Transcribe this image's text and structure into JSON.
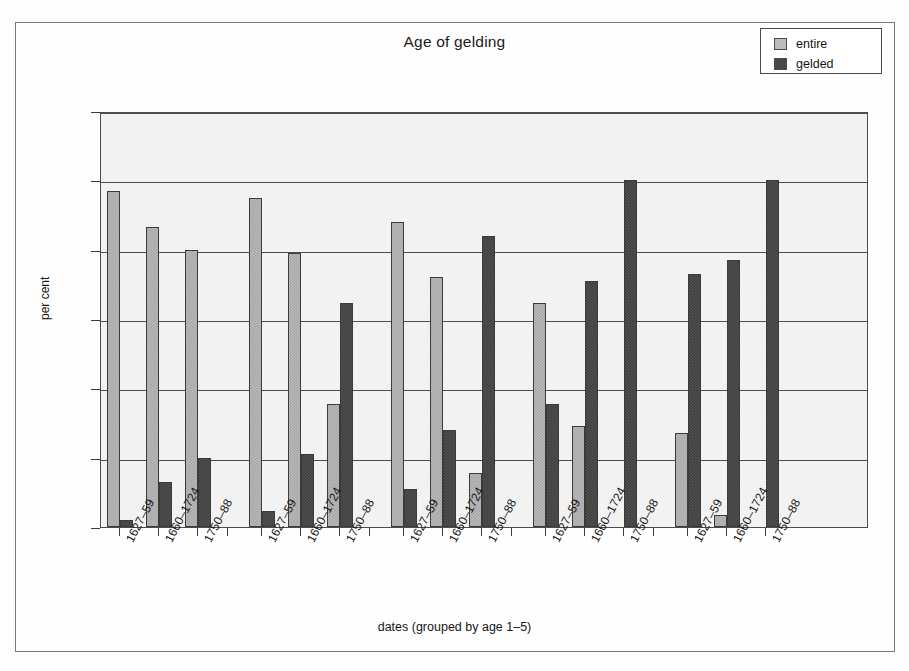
{
  "figure": {
    "title": "Age of gelding",
    "xlabel": "dates (grouped by age 1–5)",
    "ylabel": "per cent"
  },
  "legend": {
    "position": "top-right",
    "items": [
      {
        "label": "entire",
        "color": "#b4b4b4",
        "series": "entire"
      },
      {
        "label": "gelded",
        "color": "#3f3f3f",
        "series": "gelded"
      }
    ]
  },
  "chart_data": {
    "type": "bar",
    "title": "Age of gelding",
    "xlabel": "dates (grouped by age 1–5)",
    "ylabel": "per cent",
    "ylim": [
      0,
      120
    ],
    "yticks": [
      0,
      20,
      40,
      60,
      80,
      100,
      120
    ],
    "grid": true,
    "grouping": "5 age groups (age 1–5), each with 3 date periods",
    "categories": [
      "1627–59",
      "1660–1724",
      "1750–88",
      "1627–59",
      "1660–1724",
      "1750–88",
      "1627–59",
      "1660–1724",
      "1750–88",
      "1627–59",
      "1660–1724",
      "1750–88",
      "1627–59",
      "1660–1724",
      "1750–88"
    ],
    "series": [
      {
        "name": "entire",
        "values": [
          97,
          86.5,
          80,
          95,
          79,
          35.5,
          88,
          72,
          15.5,
          64.5,
          29,
          0,
          27,
          3.5,
          0
        ]
      },
      {
        "name": "gelded",
        "values": [
          2,
          13,
          20,
          4.5,
          21,
          64.5,
          11,
          28,
          84,
          35.5,
          71,
          100,
          73,
          77,
          100
        ]
      }
    ],
    "groups": [
      {
        "age": "1",
        "labels": [
          "1627–59",
          "1660–1724",
          "1750–88"
        ]
      },
      {
        "age": "2",
        "labels": [
          "1627–59",
          "1660–1724",
          "1750–88"
        ]
      },
      {
        "age": "3",
        "labels": [
          "1627–59",
          "1660–1724",
          "1750–88"
        ]
      },
      {
        "age": "4",
        "labels": [
          "1627–59",
          "1660–1724",
          "1750–88"
        ]
      },
      {
        "age": "5",
        "labels": [
          "1627–59",
          "1660–1724",
          "1750–88"
        ]
      }
    ]
  }
}
